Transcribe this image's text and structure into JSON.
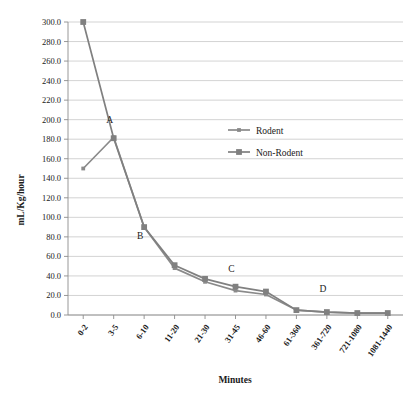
{
  "chart_data": {
    "type": "line",
    "title": "",
    "xlabel": "Minutes",
    "ylabel": "mL/Kg/hour",
    "categories": [
      "0-2",
      "3-5",
      "6-10",
      "11-20",
      "21-30",
      "31-45",
      "46-60",
      "61-360",
      "361-720",
      "721-1080",
      "1081-1440"
    ],
    "series": [
      {
        "name": "Rodent",
        "values": [
          150,
          182,
          90,
          48,
          34,
          25,
          21,
          5,
          3,
          2,
          2
        ]
      },
      {
        "name": "Non-Rodent",
        "values": [
          300,
          181,
          90,
          51,
          37,
          29,
          24,
          5,
          3,
          2,
          2
        ]
      }
    ],
    "ylim": [
      0,
      300
    ],
    "yticks": [
      "0.0",
      "20.0",
      "40.0",
      "60.0",
      "80.0",
      "100.0",
      "120.0",
      "140.0",
      "160.0",
      "180.0",
      "200.0",
      "220.0",
      "240.0",
      "260.0",
      "280.0",
      "300.0"
    ],
    "ytick_values": [
      0,
      20,
      40,
      60,
      80,
      100,
      120,
      140,
      160,
      180,
      200,
      220,
      240,
      260,
      280,
      300
    ],
    "grid": true,
    "legend_position": "inside-upper-center",
    "annotations": [
      {
        "text": "A",
        "category": "3-5",
        "value": 197
      },
      {
        "text": "B",
        "category": "6-10",
        "value": 78
      },
      {
        "text": "C",
        "category": "31-45",
        "value": 44
      },
      {
        "text": "D",
        "category": "361-720",
        "value": 24
      }
    ],
    "colors": {
      "rodent": "#8a8a8a",
      "non_rodent": "#808080",
      "grid": "#c8c8c8",
      "axis": "#8c8c8c",
      "text": "#1a1a1a"
    }
  }
}
